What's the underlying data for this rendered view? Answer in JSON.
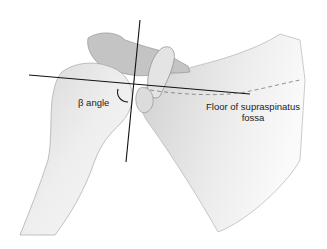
{
  "figure": {
    "labels": {
      "beta_angle": "β angle",
      "floor_line1": "Floor of supraspinatus",
      "floor_line2": "fossa"
    },
    "colors": {
      "bone_fill": "#ececec",
      "bone_shade": "#bdbdbd",
      "bone_outline": "#8a8a8a",
      "line": "#111111",
      "dashed": "#777777",
      "background": "#ffffff"
    }
  }
}
